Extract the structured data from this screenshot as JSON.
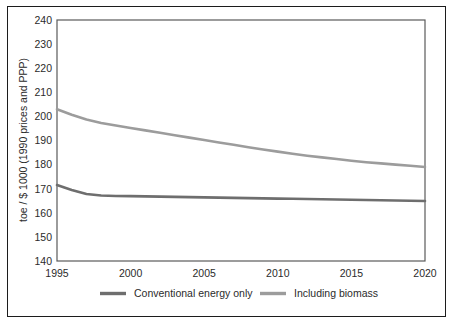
{
  "chart_data": {
    "type": "line",
    "title": "",
    "subtitle": "",
    "xlabel": "",
    "ylabel": "toe / $ 1000 (1990 prices and PPP)",
    "xlim": [
      1995,
      2020
    ],
    "ylim": [
      140,
      240
    ],
    "grid": false,
    "legend_position": "bottom",
    "x_ticks": [
      "1995",
      "2000",
      "2005",
      "2010",
      "2015",
      "2020"
    ],
    "x_tick_values": [
      1995,
      2000,
      2005,
      2010,
      2015,
      2020
    ],
    "y_ticks": [
      "140",
      "150",
      "160",
      "170",
      "180",
      "190",
      "200",
      "210",
      "220",
      "230",
      "240"
    ],
    "y_tick_values": [
      140,
      150,
      160,
      170,
      180,
      190,
      200,
      210,
      220,
      230,
      240
    ],
    "x": [
      1995,
      1996,
      1997,
      1998,
      1999,
      2000,
      2001,
      2002,
      2003,
      2004,
      2005,
      2006,
      2007,
      2008,
      2009,
      2010,
      2011,
      2012,
      2013,
      2014,
      2015,
      2016,
      2017,
      2018,
      2019,
      2020
    ],
    "series": [
      {
        "name": "Conventional energy only",
        "color": "#6e6e6e",
        "values": [
          171.5,
          169.5,
          167.8,
          167.2,
          167.0,
          166.9,
          166.8,
          166.7,
          166.6,
          166.5,
          166.4,
          166.3,
          166.2,
          166.1,
          166.0,
          165.9,
          165.8,
          165.7,
          165.6,
          165.5,
          165.4,
          165.3,
          165.2,
          165.1,
          165.0,
          164.9
        ]
      },
      {
        "name": "Including biomass",
        "color": "#9c9c9c",
        "values": [
          203.0,
          200.7,
          198.7,
          197.3,
          196.2,
          195.2,
          194.2,
          193.2,
          192.2,
          191.2,
          190.2,
          189.2,
          188.2,
          187.2,
          186.3,
          185.4,
          184.5,
          183.7,
          183.0,
          182.3,
          181.6,
          181.0,
          180.5,
          180.0,
          179.5,
          179.0
        ]
      }
    ]
  },
  "legend": {
    "items": [
      {
        "label": "Conventional energy only",
        "color": "#6e6e6e"
      },
      {
        "label": "Including biomass",
        "color": "#9c9c9c"
      }
    ]
  },
  "axes": {
    "y_title": "toe / $ 1000 (1990 prices and PPP)"
  }
}
